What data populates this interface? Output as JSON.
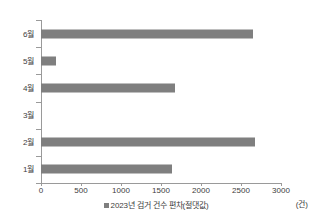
{
  "chart_data": {
    "type": "bar",
    "orientation": "horizontal",
    "title": "",
    "xlabel": "",
    "ylabel": "",
    "unit_label": "(건)",
    "categories": [
      "6월",
      "5월",
      "4월",
      "3월",
      "2월",
      "1월"
    ],
    "values": [
      2650,
      190,
      1670,
      0,
      2680,
      1640
    ],
    "series": [
      {
        "name": "2023년 검거 건수 편차(절댓값)",
        "color": "#7f7f7f",
        "values": [
          2650,
          190,
          1670,
          0,
          2680,
          1640
        ]
      }
    ],
    "xlim": [
      0,
      3000
    ],
    "xticks": [
      0,
      500,
      1000,
      1500,
      2000,
      2500,
      3000
    ],
    "xtick_labels": [
      "0",
      "500",
      "1000",
      "1500",
      "2000",
      "2500",
      "3000"
    ],
    "grid": false,
    "legend": {
      "position": "bottom",
      "entries": [
        {
          "label": "2023년 검거 건수 편차(절댓값)",
          "color": "#7f7f7f"
        }
      ]
    }
  },
  "colors": {
    "bar": "#7f7f7f",
    "axis": "#9a9a9a",
    "text": "#3d3d3d",
    "background": "#ffffff"
  }
}
